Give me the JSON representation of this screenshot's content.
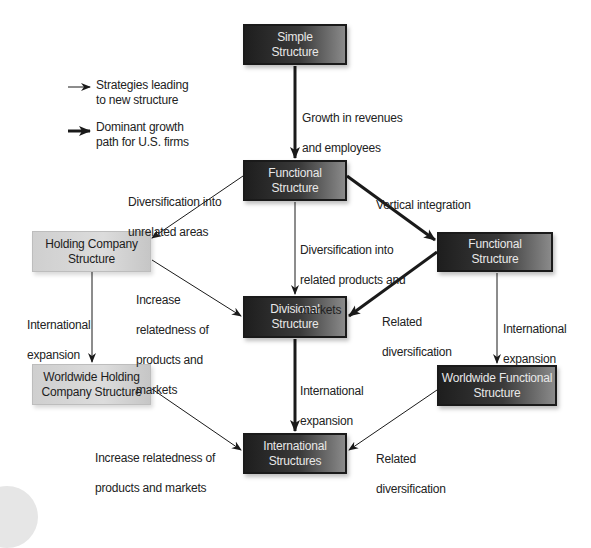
{
  "legend": {
    "thin_arrow_label": "Strategies leading to new structure",
    "thin_arrow_line1": "Strategies leading",
    "thin_arrow_line2": "to new structure",
    "thick_arrow_label": "Dominant growth path for U.S. firms",
    "thick_arrow_line1": "Dominant growth",
    "thick_arrow_line2": "path for U.S. firms"
  },
  "nodes": {
    "simple": {
      "line1": "Simple",
      "line2": "Structure",
      "style": "dark"
    },
    "functional_center": {
      "line1": "Functional",
      "line2": "Structure",
      "style": "dark"
    },
    "holding": {
      "line1": "Holding Company",
      "line2": "Structure",
      "style": "light"
    },
    "functional_right": {
      "line1": "Functional",
      "line2": "Structure",
      "style": "dark"
    },
    "divisional": {
      "line1": "Divisional",
      "line2": "Structure",
      "style": "dark"
    },
    "worldwide_holding": {
      "line1": "Worldwide Holding",
      "line2": "Company Structure",
      "style": "light"
    },
    "worldwide_functional": {
      "line1": "Worldwide Functional",
      "line2": "Structure",
      "style": "dark"
    },
    "international": {
      "line1": "International",
      "line2": "Structures",
      "style": "dark"
    }
  },
  "edges": [
    {
      "from": "simple",
      "to": "functional_center",
      "label": "Growth in revenues and employees",
      "dominant": true
    },
    {
      "from": "functional_center",
      "to": "holding",
      "label": "Diversification into unrelated areas",
      "dominant": false
    },
    {
      "from": "functional_center",
      "to": "functional_right",
      "label": "Vertical integration",
      "dominant": true
    },
    {
      "from": "functional_center",
      "to": "divisional",
      "label": "Diversification into related products and markets",
      "dominant": false
    },
    {
      "from": "holding",
      "to": "divisional",
      "label": "Increase relatedness of products and markets",
      "dominant": false
    },
    {
      "from": "functional_right",
      "to": "divisional",
      "label": "Related diversification",
      "dominant": true
    },
    {
      "from": "holding",
      "to": "worldwide_holding",
      "label": "International expansion",
      "dominant": false
    },
    {
      "from": "functional_right",
      "to": "worldwide_functional",
      "label": "International expansion",
      "dominant": false
    },
    {
      "from": "divisional",
      "to": "international",
      "label": "International expansion",
      "dominant": true
    },
    {
      "from": "worldwide_holding",
      "to": "international",
      "label": "Increase relatedness of products and markets",
      "dominant": false
    },
    {
      "from": "worldwide_functional",
      "to": "international",
      "label": "Related diversification",
      "dominant": false
    }
  ],
  "edge_labels": {
    "growth": {
      "line1": "Growth in revenues",
      "line2": "and employees"
    },
    "unrelated": {
      "line1": "Diversification into",
      "line2": "unrelated areas"
    },
    "vertical": {
      "line1": "Vertical integration"
    },
    "related_products": {
      "line1": "Diversification into",
      "line2": "related products and",
      "line3": "markets"
    },
    "increase_left": {
      "line1": "Increase",
      "line2": "relatedness of",
      "line3": "products and",
      "line4": "markets"
    },
    "related_div_right": {
      "line1": "Related",
      "line2": "diversification"
    },
    "intl_left": {
      "line1": "International",
      "line2": "expansion"
    },
    "intl_right": {
      "line1": "International",
      "line2": "expansion"
    },
    "intl_center": {
      "line1": "International",
      "line2": "expansion"
    },
    "increase_bottom": {
      "line1": "Increase relatedness of",
      "line2": "products and markets"
    },
    "related_div_bottom": {
      "line1": "Related",
      "line2": "diversification"
    }
  },
  "colors": {
    "dark_box": "#2a2a2a",
    "light_box": "#d4d4d4",
    "arrow": "#1a1a1a",
    "text": "#222222"
  }
}
